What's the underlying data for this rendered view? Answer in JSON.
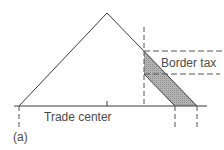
{
  "diagram": {
    "labels": {
      "trade_center": "Trade center",
      "border_tax": "Border tax",
      "panel": "(a)"
    },
    "colors": {
      "line": "#3a3a3a",
      "dash": "#555555",
      "shade": "#a9a9a9",
      "text": "#4a4a4a"
    },
    "geometry": {
      "baseline": {
        "x1": 14,
        "x2": 207,
        "y": 106
      },
      "apex": {
        "x": 107,
        "y": 13
      },
      "left_foot": {
        "x": 19,
        "y": 106
      },
      "right_foot_outer": {
        "x": 197,
        "y": 106
      },
      "right_foot_inner": {
        "x": 175,
        "y": 106
      },
      "border_x": 144,
      "tax_upper_y": 51,
      "tax_lower_y": 74
    }
  }
}
